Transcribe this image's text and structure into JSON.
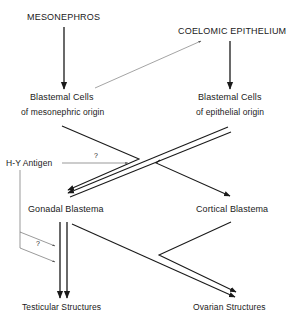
{
  "diagram": {
    "nodes": {
      "mesonephros": "MESONEPHROS",
      "coelomic_epithelium": "COELOMIC EPITHELIUM",
      "blastemal_mesonephric_line1": "Blastemal Cells",
      "blastemal_mesonephric_line2": "of mesonephric origin",
      "blastemal_epithelial_line1": "Blastemal Cells",
      "blastemal_epithelial_line2": "of epithelial origin",
      "hy_antigen": "H-Y Antigen",
      "gonadal_blastema": "Gonadal Blastema",
      "cortical_blastema": "Cortical Blastema",
      "testicular_structures": "Testicular Structures",
      "ovarian_structures": "Ovarian Structures"
    },
    "annotations": {
      "hy_question": "?",
      "lower_question": "?"
    },
    "edges": [
      {
        "from": "MESONEPHROS",
        "to": "Blastemal Cells of mesonephric origin",
        "style": "single"
      },
      {
        "from": "COELOMIC EPITHELIUM",
        "to": "Blastemal Cells of epithelial origin",
        "style": "single"
      },
      {
        "from": "Blastemal Cells of mesonephric origin",
        "to": "COELOMIC EPITHELIUM",
        "style": "thin"
      },
      {
        "from": "Blastemal Cells of mesonephric origin",
        "to": "Gonadal Blastema",
        "style": "single"
      },
      {
        "from": "Blastemal Cells of epithelial origin",
        "to": "Gonadal Blastema",
        "style": "double"
      },
      {
        "from": "Blastemal Cells of epithelial origin",
        "to": "Cortical Blastema",
        "style": "single"
      },
      {
        "from": "H-Y Antigen",
        "to": "Gonadal Blastema pathway",
        "style": "thin",
        "label": "?"
      },
      {
        "from": "H-Y Antigen",
        "to": "Testicular Structures pathway",
        "style": "thin",
        "label": "?"
      },
      {
        "from": "Gonadal Blastema",
        "to": "Testicular Structures",
        "style": "double"
      },
      {
        "from": "Gonadal Blastema",
        "to": "Ovarian Structures",
        "style": "single"
      },
      {
        "from": "Cortical Blastema",
        "to": "Ovarian Structures",
        "style": "single"
      }
    ],
    "colors": {
      "line": "#1a1a1a",
      "thin_line": "#555555",
      "background": "#ffffff"
    }
  }
}
